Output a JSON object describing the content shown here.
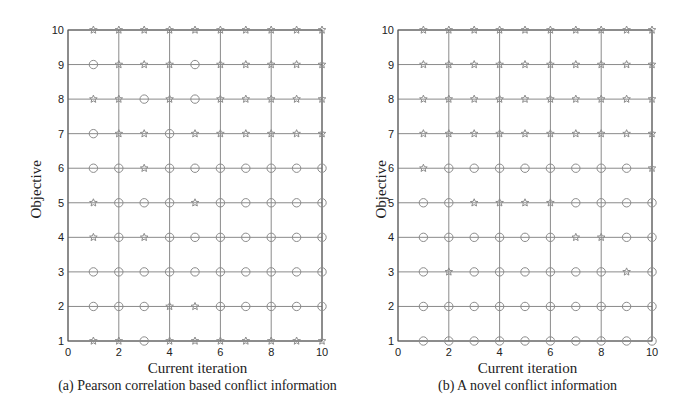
{
  "chart_data": [
    {
      "type": "scatter",
      "title": "",
      "caption": "(a) Pearson correlation based conflict information",
      "xlabel": "Current iteration",
      "ylabel": "Objective",
      "xlim": [
        0,
        10
      ],
      "ylim": [
        1,
        10
      ],
      "xticks": [
        0,
        2,
        4,
        6,
        8,
        10
      ],
      "yticks": [
        1,
        2,
        3,
        4,
        5,
        6,
        7,
        8,
        9,
        10
      ],
      "grid": true,
      "marker_legend": {
        "C": "circle",
        "S": "star"
      },
      "x": [
        1,
        2,
        3,
        4,
        5,
        6,
        7,
        8,
        9,
        10
      ],
      "rows": [
        {
          "objective": 10,
          "markers": [
            "S",
            "S",
            "S",
            "S",
            "S",
            "S",
            "S",
            "S",
            "S",
            "S"
          ]
        },
        {
          "objective": 9,
          "markers": [
            "C",
            "S",
            "S",
            "S",
            "C",
            "S",
            "S",
            "S",
            "S",
            "S"
          ]
        },
        {
          "objective": 8,
          "markers": [
            "S",
            "S",
            "C",
            "S",
            "C",
            "S",
            "S",
            "S",
            "S",
            "S"
          ]
        },
        {
          "objective": 7,
          "markers": [
            "C",
            "S",
            "S",
            "C",
            "S",
            "S",
            "S",
            "S",
            "S",
            "S"
          ]
        },
        {
          "objective": 6,
          "markers": [
            "C",
            "C",
            "S",
            "C",
            "C",
            "C",
            "C",
            "C",
            "C",
            "C"
          ]
        },
        {
          "objective": 5,
          "markers": [
            "S",
            "C",
            "C",
            "C",
            "S",
            "C",
            "C",
            "C",
            "C",
            "C"
          ]
        },
        {
          "objective": 4,
          "markers": [
            "S",
            "C",
            "S",
            "C",
            "C",
            "C",
            "C",
            "C",
            "C",
            "C"
          ]
        },
        {
          "objective": 3,
          "markers": [
            "C",
            "C",
            "C",
            "C",
            "C",
            "C",
            "C",
            "C",
            "C",
            "C"
          ]
        },
        {
          "objective": 2,
          "markers": [
            "C",
            "C",
            "C",
            "S",
            "S",
            "C",
            "C",
            "C",
            "C",
            "C"
          ]
        },
        {
          "objective": 1,
          "markers": [
            "S",
            "S",
            "C",
            "S",
            "S",
            "S",
            "S",
            "S",
            "S",
            "S"
          ]
        }
      ]
    },
    {
      "type": "scatter",
      "title": "",
      "caption": "(b) A novel conflict information",
      "xlabel": "Current iteration",
      "ylabel": "Objective",
      "xlim": [
        0,
        10
      ],
      "ylim": [
        1,
        10
      ],
      "xticks": [
        0,
        2,
        4,
        6,
        8,
        10
      ],
      "yticks": [
        1,
        2,
        3,
        4,
        5,
        6,
        7,
        8,
        9,
        10
      ],
      "grid": true,
      "marker_legend": {
        "C": "circle",
        "S": "star"
      },
      "x": [
        1,
        2,
        3,
        4,
        5,
        6,
        7,
        8,
        9,
        10
      ],
      "rows": [
        {
          "objective": 10,
          "markers": [
            "S",
            "S",
            "S",
            "S",
            "S",
            "S",
            "S",
            "S",
            "S",
            "S"
          ]
        },
        {
          "objective": 9,
          "markers": [
            "S",
            "S",
            "S",
            "S",
            "S",
            "S",
            "S",
            "S",
            "S",
            "S"
          ]
        },
        {
          "objective": 8,
          "markers": [
            "S",
            "S",
            "S",
            "S",
            "S",
            "S",
            "S",
            "S",
            "S",
            "S"
          ]
        },
        {
          "objective": 7,
          "markers": [
            "S",
            "S",
            "S",
            "S",
            "S",
            "S",
            "S",
            "S",
            "S",
            "S"
          ]
        },
        {
          "objective": 6,
          "markers": [
            "S",
            "C",
            "C",
            "C",
            "C",
            "C",
            "C",
            "C",
            "C",
            "S"
          ]
        },
        {
          "objective": 5,
          "markers": [
            "C",
            "C",
            "S",
            "S",
            "S",
            "S",
            "C",
            "C",
            "C",
            "C"
          ]
        },
        {
          "objective": 4,
          "markers": [
            "C",
            "C",
            "C",
            "C",
            "C",
            "C",
            "S",
            "S",
            "C",
            "C"
          ]
        },
        {
          "objective": 3,
          "markers": [
            "C",
            "S",
            "C",
            "C",
            "C",
            "C",
            "C",
            "C",
            "S",
            "C"
          ]
        },
        {
          "objective": 2,
          "markers": [
            "C",
            "C",
            "C",
            "C",
            "C",
            "C",
            "C",
            "C",
            "C",
            "C"
          ]
        },
        {
          "objective": 1,
          "markers": [
            "C",
            "C",
            "C",
            "C",
            "C",
            "C",
            "C",
            "C",
            "C",
            "C"
          ]
        }
      ]
    }
  ],
  "panels": [
    {
      "caption": "(a) Pearson correlation based conflict information",
      "xlabel": "Current iteration",
      "ylabel": "Objective"
    },
    {
      "caption": "(b) A novel conflict information",
      "xlabel": "Current iteration",
      "ylabel": "Objective"
    }
  ],
  "colors": {
    "axis": "#555555",
    "grid": "#8a8a8a",
    "marker": "#8c8c8c",
    "text": "#222222"
  }
}
